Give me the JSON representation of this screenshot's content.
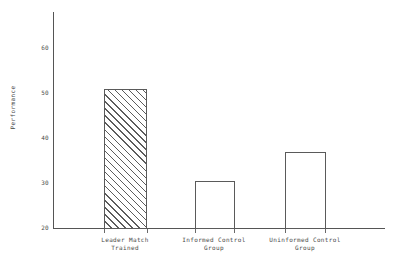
{
  "chart_data": {
    "type": "bar",
    "title": "",
    "subtitle": "",
    "xlabel": "",
    "ylabel": "Performance",
    "categories": [
      "Leader Match Trained",
      "Informed Control Group",
      "Uninformed Control Group"
    ],
    "category_lines": [
      [
        "Leader Match",
        "Trained"
      ],
      [
        "Informed Control",
        "Group"
      ],
      [
        "Uninformed Control",
        "Group"
      ]
    ],
    "values": [
      51,
      30.6,
      37
    ],
    "value_labels": [
      "51",
      "31",
      "37"
    ],
    "ylim": [
      20,
      68
    ],
    "yticks": [
      20,
      30,
      40,
      50,
      60
    ],
    "ytick_labels": [
      "20",
      "30",
      "40",
      "50",
      "60"
    ],
    "grid": false,
    "legend": "none",
    "bar_styles": [
      "hatched-diagonal",
      "outline",
      "outline"
    ],
    "colors": {
      "axis": "#555555",
      "bar_outline": "#5a5a5a",
      "bar_fill": "#ffffff",
      "hatch": "#5c5c5c",
      "text": "#4a4a4a",
      "background": "#ffffff"
    }
  }
}
